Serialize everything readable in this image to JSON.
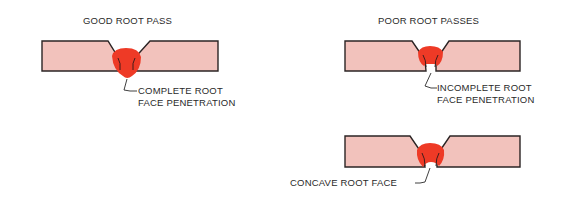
{
  "colors": {
    "plate_fill": "#f2c2bc",
    "plate_stroke": "#2b2424",
    "weld_fill": "#ee3a26",
    "text": "#2a2a2a"
  },
  "panels": {
    "good": {
      "title": "GOOD ROOT PASS",
      "callout_line1": "COMPLETE ROOT",
      "callout_line2": "FACE PENETRATION"
    },
    "poor": {
      "title": "POOR ROOT PASSES",
      "examples": [
        {
          "callout_line1": "INCOMPLETE ROOT",
          "callout_line2": "FACE PENETRATION"
        },
        {
          "callout_line1": "CONCAVE ROOT FACE"
        }
      ]
    }
  }
}
